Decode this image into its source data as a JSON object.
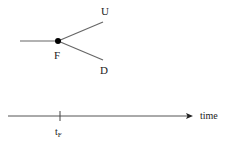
{
  "tree": {
    "root_label": "F",
    "branches": [
      {
        "label": "U",
        "direction": "up"
      },
      {
        "label": "D",
        "direction": "down"
      }
    ]
  },
  "timeline": {
    "axis_label": "time",
    "tick": {
      "base": "t",
      "subscript": "F"
    }
  },
  "colors": {
    "line": "#555555",
    "node": "#000000",
    "text": "#222222"
  }
}
